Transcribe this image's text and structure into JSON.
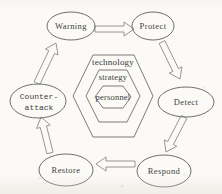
{
  "diagram": {
    "type": "cycle-diagram",
    "nodes": {
      "warning": {
        "label": "Warning"
      },
      "protect": {
        "label": "Protect"
      },
      "detect": {
        "label": "Detect"
      },
      "respond": {
        "label": "Respond"
      },
      "restore": {
        "label": "Restore"
      },
      "counter_attack": {
        "label": "Counter-attack",
        "line1": "Counter-",
        "line2": "attack"
      }
    },
    "flow_order": [
      "Warning",
      "Protect",
      "Detect",
      "Respond",
      "Restore",
      "Counter-attack"
    ],
    "core_hexagons": {
      "outer": "technology",
      "middle": "strategy",
      "inner": "personnel"
    },
    "colors": {
      "background": "#fbfaf7",
      "shape_stroke": "#6e6e6e",
      "arrow_stroke": "#8b8b8b",
      "text": "#3f3f3f"
    }
  }
}
